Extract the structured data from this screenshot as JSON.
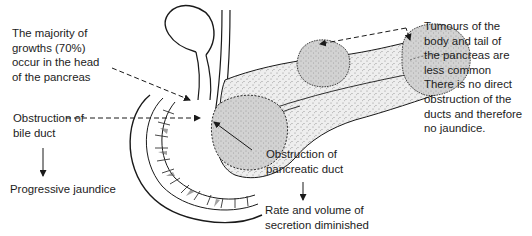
{
  "diagram": {
    "labels": {
      "head_growths": "The majority of\ngrowths (70%)\noccur in the head\nof the pancreas",
      "bile_duct_obstruction": "Obstruction of\nbile duct",
      "bile_duct_consequence": "Progressive jaundice",
      "pancreatic_duct_obstruction": "Obstruction of\npancreatic duct",
      "pancreatic_duct_consequence": "Rate and volume of\nsecretion diminished",
      "body_tail_tumours": "Tumours of the\nbody and tail of\nthe pancreas are\nless common\nThere is no direct\nobstruction of the\nducts and therefore\nno jaundice."
    },
    "structures": [
      "gallbladder",
      "common-bile-duct",
      "duodenum",
      "pancreas-head",
      "pancreas-body",
      "pancreas-tail",
      "pancreatic-duct",
      "tumour-head",
      "tumour-body",
      "tumour-tail"
    ],
    "colors": {
      "line": "#1a1a1a",
      "tumour_fill": "#d4d4d4",
      "pancreas_fill": "#ececec",
      "background": "#ffffff"
    }
  }
}
